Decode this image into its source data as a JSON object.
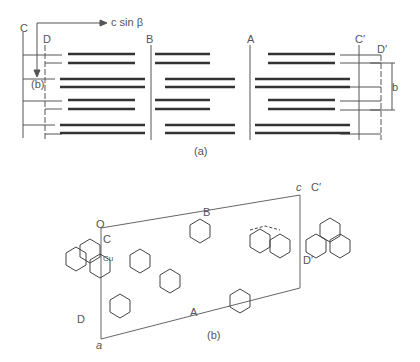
{
  "panel_a": {
    "caption": "(a)",
    "axis_label": "c sin β",
    "axis_b_label": "(b)",
    "dimension_label": "b",
    "column_labels": [
      "C",
      "D",
      "B",
      "A",
      "C′",
      "D′"
    ]
  },
  "panel_b": {
    "caption": "(b)",
    "labels": {
      "origin": "O",
      "axis_c": "c",
      "axis_a": "a",
      "C": "C",
      "Cu": "Cu",
      "B": "B",
      "A": "A",
      "D": "D",
      "Cprime": "C′",
      "Dprime": "D′"
    }
  }
}
